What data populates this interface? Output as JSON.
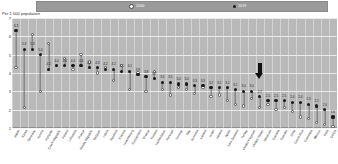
{
  "axis_title": "Per 1 000 population",
  "legend": [
    {
      "name": "series-2000",
      "label": "2000",
      "marker": "open-circle-icon"
    },
    {
      "name": "series-2019",
      "label": "2019",
      "marker": "filled-circle-icon"
    }
  ],
  "annotation": {
    "name": "down-arrow-annotation",
    "index": 30
  },
  "colors": {
    "plot_background": "#b9b9b9",
    "legend_bar": "#9a9a9a",
    "marker_2019": "#1a1a1a",
    "marker_2000": "#ffffff",
    "stem": "#6f6f6f"
  },
  "chart_data": {
    "type": "scatter",
    "title": "",
    "subtitle": "",
    "xlabel": "",
    "ylabel": "Per 1 000 population",
    "ylim": [
      1,
      7
    ],
    "yticks": [
      1,
      2,
      3,
      4,
      5,
      6,
      7
    ],
    "grid": true,
    "legend_position": "top",
    "categories": [
      "Japan",
      "Korea",
      "Germany",
      "Austria",
      "Hungary",
      "Czech Republic",
      "Poland",
      "Lithuania",
      "France",
      "Slovak Republic",
      "Belgium",
      "Latvia",
      "Slovenia",
      "Estonia",
      "Luxembourg",
      "Switzerland",
      "Greece",
      "Finland",
      "Netherlands",
      "Portugal",
      "Norway",
      "Italy",
      "Australia",
      "Iceland",
      "Israel",
      "Ireland",
      "Spain",
      "New Zealand",
      "Turkey",
      "United Kingdom",
      "United States",
      "Denmark",
      "Canada",
      "Sweden",
      "Chile",
      "Costa Rica",
      "Colombia",
      "Mexico",
      "India",
      "OECD"
    ],
    "series": [
      {
        "name": "2019",
        "marker": "filled-circle",
        "values": [
          6.3,
          5.3,
          5.3,
          5.0,
          4.2,
          4.4,
          4.4,
          4.4,
          4.4,
          4.3,
          4.3,
          4.2,
          4.2,
          4.1,
          4.1,
          3.9,
          3.8,
          3.7,
          3.5,
          3.5,
          3.4,
          3.4,
          3.3,
          3.3,
          3.2,
          3.2,
          3.2,
          3.1,
          3.0,
          3.0,
          2.7,
          2.5,
          2.5,
          2.5,
          2.4,
          2.4,
          2.3,
          2.2,
          2.0,
          1.6
        ]
      },
      {
        "name": "2000",
        "marker": "open-circle",
        "values": [
          4.3,
          2.1,
          6.1,
          3.0,
          5.6,
          4.4,
          4.8,
          4.2,
          5.0,
          4.6,
          4.0,
          4.3,
          3.6,
          4.4,
          3.1,
          4.0,
          3.0,
          4.1,
          3.1,
          2.8,
          3.2,
          3.1,
          2.9,
          3.2,
          2.7,
          2.8,
          2.5,
          2.3,
          2.2,
          2.6,
          2.1,
          2.3,
          2.0,
          2.1,
          1.9,
          1.6,
          1.5,
          1.3,
          1.2,
          1.1
        ]
      }
    ],
    "value_labels_series": "2019"
  }
}
